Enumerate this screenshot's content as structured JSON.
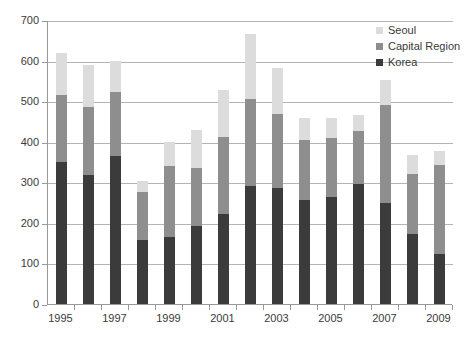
{
  "chart_data": {
    "type": "bar",
    "barmode": "stacked",
    "title": "",
    "xlabel": "",
    "ylabel": "",
    "grid": true,
    "legend_position": "top-right",
    "ylim": [
      0,
      700
    ],
    "yticks": [
      0,
      100,
      200,
      300,
      400,
      500,
      600,
      700
    ],
    "ytick_labels": [
      "0",
      "100",
      "200",
      "300",
      "400",
      "500",
      "600",
      "700"
    ],
    "categories": [
      1995,
      1996,
      1997,
      1998,
      1999,
      2000,
      2001,
      2002,
      2003,
      2004,
      2005,
      2006,
      2007,
      2008,
      2009
    ],
    "xtick_labels": [
      "1995",
      "1997",
      "1999",
      "2001",
      "2003",
      "2005",
      "2007",
      "2009"
    ],
    "xtick_categories": [
      1995,
      1997,
      1999,
      2001,
      2003,
      2005,
      2007,
      2009
    ],
    "series": [
      {
        "name": "Korea",
        "color": "#3b3b3b",
        "values": [
          350,
          318,
          365,
          157,
          166,
          192,
          223,
          290,
          287,
          256,
          263,
          295,
          250,
          172,
          124
        ]
      },
      {
        "name": "Capital Region",
        "color": "#8e8e8e",
        "values": [
          165,
          168,
          158,
          120,
          175,
          144,
          188,
          215,
          181,
          147,
          146,
          132,
          240,
          148,
          219
        ]
      },
      {
        "name": "Seoul",
        "color": "#dcdcdc",
        "values": [
          103,
          104,
          76,
          26,
          59,
          94,
          116,
          160,
          114,
          56,
          50,
          39,
          62,
          48,
          35
        ]
      }
    ],
    "cumulative_tops": {
      "korea": [
        350,
        318,
        365,
        157,
        166,
        192,
        223,
        290,
        287,
        256,
        263,
        295,
        250,
        172,
        124
      ],
      "capital_region": [
        515,
        486,
        523,
        277,
        341,
        336,
        411,
        505,
        468,
        403,
        409,
        427,
        490,
        320,
        343
      ],
      "seoul": [
        618,
        590,
        599,
        303,
        400,
        430,
        527,
        665,
        582,
        459,
        459,
        466,
        552,
        368,
        378
      ]
    }
  },
  "legend": {
    "items": [
      {
        "label": "Seoul",
        "color": "#dcdcdc"
      },
      {
        "label": "Capital Region",
        "color": "#8e8e8e"
      },
      {
        "label": "Korea",
        "color": "#3b3b3b"
      }
    ]
  }
}
